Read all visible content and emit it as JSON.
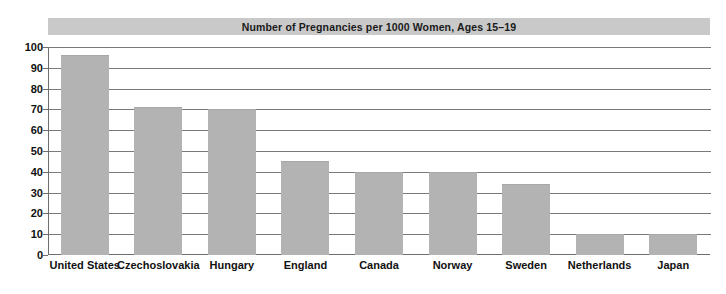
{
  "chart_data": {
    "type": "bar",
    "title": "Number of Pregnancies per 1000 Women, Ages 15–19",
    "xlabel": "",
    "ylabel": "",
    "ylim": [
      0,
      100
    ],
    "yticks": [
      0,
      10,
      20,
      30,
      40,
      50,
      60,
      70,
      80,
      90,
      100
    ],
    "ytick_labels": [
      "0",
      "10",
      "20",
      "30",
      "40",
      "50",
      "60",
      "70",
      "80",
      "90",
      "100"
    ],
    "grid": true,
    "legend": false,
    "categories": [
      "United States",
      "Czechoslovakia",
      "Hungary",
      "England",
      "Canada",
      "Norway",
      "Sweden",
      "Netherlands",
      "Japan"
    ],
    "values": [
      96,
      71,
      70,
      45,
      40,
      40,
      34,
      10,
      10
    ],
    "bar_color": "#b3b3b3",
    "title_banner_color": "#c9c9c9",
    "axis_color": "#6e6e6e",
    "gridline_color": "#7a7a7a"
  }
}
